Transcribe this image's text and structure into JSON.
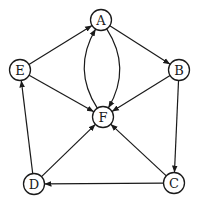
{
  "diagram": {
    "type": "directed-graph",
    "nodes": [
      {
        "id": "A",
        "label": "A",
        "x": 101,
        "y": 20
      },
      {
        "id": "B",
        "label": "B",
        "x": 179,
        "y": 70
      },
      {
        "id": "C",
        "label": "C",
        "x": 174,
        "y": 183
      },
      {
        "id": "D",
        "label": "D",
        "x": 34,
        "y": 184
      },
      {
        "id": "E",
        "label": "E",
        "x": 20,
        "y": 70
      },
      {
        "id": "F",
        "label": "F",
        "x": 103,
        "y": 117
      }
    ],
    "edges": [
      {
        "from": "E",
        "to": "A"
      },
      {
        "from": "A",
        "to": "B"
      },
      {
        "from": "B",
        "to": "F"
      },
      {
        "from": "B",
        "to": "C"
      },
      {
        "from": "C",
        "to": "D"
      },
      {
        "from": "C",
        "to": "F"
      },
      {
        "from": "D",
        "to": "F"
      },
      {
        "from": "D",
        "to": "E"
      },
      {
        "from": "E",
        "to": "F"
      },
      {
        "from": "A",
        "to": "F",
        "curve": "right"
      },
      {
        "from": "F",
        "to": "A",
        "curve": "left"
      }
    ],
    "colors": {
      "stroke": "#1a1a1a",
      "fill": "#ffffff"
    }
  }
}
